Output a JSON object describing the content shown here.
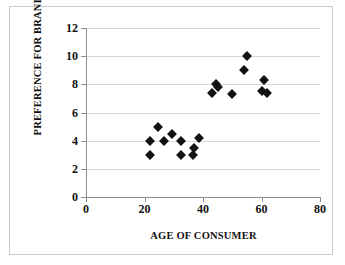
{
  "chart_data": {
    "type": "scatter",
    "title": "",
    "xlabel": "AGE OF CONSUMER",
    "ylabel": "PREFERENCE FOR BRAND A",
    "xlim": [
      0,
      80
    ],
    "ylim": [
      0,
      12
    ],
    "xticks": [
      0,
      20,
      40,
      60,
      80
    ],
    "yticks": [
      0,
      2,
      4,
      6,
      8,
      10,
      12
    ],
    "grid": "horizontal",
    "legend": "none",
    "marker": "filled-diamond",
    "marker_color": "#131313",
    "points": [
      {
        "x": 22,
        "y": 4.0
      },
      {
        "x": 22,
        "y": 3.0
      },
      {
        "x": 24.5,
        "y": 5.0
      },
      {
        "x": 26.5,
        "y": 4.0
      },
      {
        "x": 29.5,
        "y": 4.5
      },
      {
        "x": 32.5,
        "y": 4.0
      },
      {
        "x": 32.5,
        "y": 3.0
      },
      {
        "x": 36.5,
        "y": 3.0
      },
      {
        "x": 37,
        "y": 3.5
      },
      {
        "x": 38.5,
        "y": 4.2
      },
      {
        "x": 43,
        "y": 7.4
      },
      {
        "x": 44.5,
        "y": 8.0
      },
      {
        "x": 45,
        "y": 7.8
      },
      {
        "x": 50,
        "y": 7.3
      },
      {
        "x": 55,
        "y": 10.0
      },
      {
        "x": 54,
        "y": 9.0
      },
      {
        "x": 61,
        "y": 8.3
      },
      {
        "x": 60,
        "y": 7.5
      },
      {
        "x": 62,
        "y": 7.4
      }
    ],
    "series": [
      {
        "name": "Brand A preference",
        "x": [
          22,
          22,
          24.5,
          26.5,
          29.5,
          32.5,
          32.5,
          36.5,
          37,
          38.5,
          43,
          44.5,
          45,
          50,
          55,
          54,
          61,
          60,
          62
        ],
        "values": [
          4.0,
          3.0,
          5.0,
          4.0,
          4.5,
          4.0,
          3.0,
          3.0,
          3.5,
          4.2,
          7.4,
          8.0,
          7.8,
          7.3,
          10.0,
          9.0,
          8.3,
          7.5,
          7.4
        ]
      }
    ]
  },
  "axes": {
    "y_tick_labels": [
      "12",
      "10",
      "8",
      "6",
      "4",
      "2",
      "0"
    ],
    "x_tick_labels": [
      "0",
      "20",
      "40",
      "60",
      "80"
    ]
  }
}
